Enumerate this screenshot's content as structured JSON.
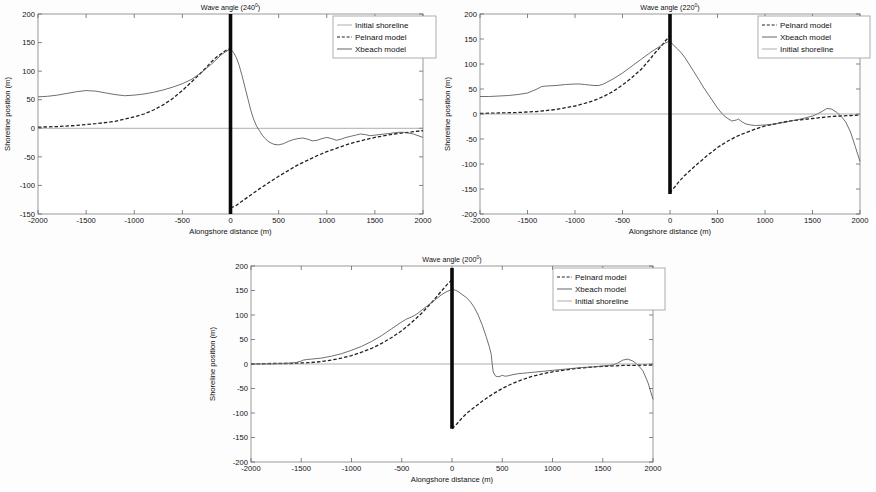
{
  "figure": {
    "panel_count": 3,
    "shared": {
      "xlabel": "Alongshore distance (m)",
      "ylabel": "Shoreline position (m)",
      "xticks": [
        "-2000",
        "-1500",
        "-1000",
        "-500",
        "0",
        "500",
        "1000",
        "1500",
        "2000"
      ],
      "degree_symbol": "0"
    }
  },
  "chart_data": [
    {
      "type": "line",
      "title": "Wave angle (240",
      "title_suffix": ")",
      "title_sup": "0",
      "wave_angle": 240,
      "xlabel": "Alongshore distance (m)",
      "ylabel": "Shoreline position (m)",
      "xlim": [
        -2000,
        2000
      ],
      "ylim": [
        -150,
        200
      ],
      "xticks": [
        -2000,
        -1500,
        -1000,
        -500,
        0,
        500,
        1000,
        1500,
        2000
      ],
      "yticks": [
        -150,
        -100,
        -50,
        0,
        50,
        100,
        150,
        200
      ],
      "ytick_labels": [
        "-150",
        "-100",
        "-50",
        "0",
        "50",
        "100",
        "150",
        "200"
      ],
      "grid": false,
      "legend_position": "upper right",
      "legend": [
        "Initial shoreline",
        "Pelnard model",
        "Xbeach model"
      ],
      "groyne": {
        "x": 0,
        "y_bottom": -150,
        "y_top": 200,
        "label": "groyne"
      },
      "series": [
        {
          "name": "Initial shoreline",
          "style": "thin-solid",
          "x": [
            -2000,
            2000
          ],
          "values": [
            0,
            0
          ]
        },
        {
          "name": "Pelnard model",
          "style": "dashed",
          "x": [
            -2000,
            -1800,
            -1600,
            -1400,
            -1200,
            -1000,
            -900,
            -800,
            -700,
            -600,
            -500,
            -400,
            -300,
            -200,
            -150,
            -100,
            -50,
            -20,
            0,
            0,
            20,
            50,
            100,
            150,
            200,
            300,
            400,
            500,
            600,
            700,
            800,
            900,
            1000,
            1100,
            1200,
            1300,
            1400,
            1500,
            1600,
            1700,
            1800,
            1900,
            2000
          ],
          "values": [
            2,
            3,
            5,
            8,
            12,
            20,
            25,
            32,
            41,
            52,
            66,
            82,
            98,
            116,
            124,
            130,
            136,
            138,
            139,
            -139,
            -138,
            -136,
            -130,
            -124,
            -118,
            -106,
            -95,
            -84,
            -74,
            -64,
            -56,
            -48,
            -41,
            -35,
            -29,
            -24,
            -20,
            -16,
            -13,
            -10,
            -8,
            -6,
            -4
          ]
        },
        {
          "name": "Xbeach model",
          "style": "solid",
          "x": [
            -2000,
            -1900,
            -1800,
            -1700,
            -1600,
            -1500,
            -1400,
            -1300,
            -1200,
            -1100,
            -1000,
            -900,
            -800,
            -700,
            -600,
            -500,
            -400,
            -300,
            -200,
            -100,
            -50,
            0,
            30,
            60,
            90,
            120,
            150,
            180,
            210,
            240,
            270,
            300,
            330,
            360,
            400,
            450,
            500,
            550,
            600,
            650,
            700,
            750,
            800,
            850,
            900,
            950,
            1000,
            1050,
            1100,
            1150,
            1200,
            1250,
            1300,
            1350,
            1400,
            1450,
            1500,
            1600,
            1700,
            1750,
            1800,
            1900,
            2000
          ],
          "values": [
            55,
            56,
            58,
            61,
            64,
            66,
            65,
            62,
            59,
            57,
            58,
            60,
            63,
            67,
            72,
            78,
            86,
            98,
            112,
            128,
            134,
            139,
            133,
            124,
            110,
            92,
            72,
            52,
            32,
            16,
            4,
            -4,
            -12,
            -18,
            -24,
            -28,
            -29,
            -27,
            -23,
            -20,
            -18,
            -17,
            -19,
            -22,
            -21,
            -18,
            -16,
            -18,
            -21,
            -19,
            -16,
            -14,
            -12,
            -10,
            -11,
            -13,
            -12,
            -10,
            -8,
            -7,
            -7,
            -10,
            -16
          ]
        }
      ]
    },
    {
      "type": "line",
      "title": "Wave angle (220",
      "title_suffix": ")",
      "title_sup": "0",
      "wave_angle": 220,
      "xlabel": "Alongshore distance (m)",
      "ylabel": "Shoreline position (m)",
      "xlim": [
        -2000,
        2000
      ],
      "ylim": [
        -200,
        200
      ],
      "xticks": [
        -2000,
        -1500,
        -1000,
        -500,
        0,
        500,
        1000,
        1500,
        2000
      ],
      "yticks": [
        -200,
        -150,
        -100,
        -50,
        0,
        50,
        100,
        150,
        200
      ],
      "ytick_labels": [
        "-200",
        "-150",
        "-100",
        "-50",
        "0",
        "50",
        "100",
        "150",
        "200"
      ],
      "grid": false,
      "legend_position": "upper right",
      "legend": [
        "Pelnard model",
        "Xbeach model",
        "Initial shoreline"
      ],
      "groyne": {
        "x": 0,
        "y_bottom": -160,
        "y_top": 200,
        "label": "groyne"
      },
      "series": [
        {
          "name": "Pelnard model",
          "style": "dashed",
          "x": [
            -2000,
            -1800,
            -1600,
            -1400,
            -1200,
            -1000,
            -900,
            -800,
            -700,
            -600,
            -500,
            -400,
            -300,
            -200,
            -150,
            -100,
            -50,
            -20,
            0,
            0,
            20,
            50,
            100,
            150,
            200,
            300,
            400,
            500,
            600,
            700,
            800,
            900,
            1000,
            1100,
            1200,
            1300,
            1400,
            1500,
            1600,
            1700,
            1800,
            1900,
            2000
          ],
          "values": [
            1,
            2,
            3,
            5,
            9,
            16,
            21,
            27,
            35,
            45,
            58,
            73,
            90,
            112,
            124,
            134,
            146,
            152,
            158,
            -158,
            -152,
            -146,
            -134,
            -124,
            -115,
            -98,
            -82,
            -67,
            -55,
            -45,
            -37,
            -30,
            -24,
            -20,
            -16,
            -13,
            -11,
            -9,
            -7,
            -5,
            -4,
            -3,
            -2
          ]
        },
        {
          "name": "Xbeach model",
          "style": "solid",
          "x": [
            -2000,
            -1900,
            -1800,
            -1700,
            -1600,
            -1500,
            -1400,
            -1350,
            -1300,
            -1200,
            -1100,
            -1000,
            -950,
            -900,
            -850,
            -800,
            -750,
            -700,
            -600,
            -500,
            -400,
            -300,
            -200,
            -100,
            -50,
            0,
            40,
            80,
            120,
            160,
            200,
            250,
            300,
            350,
            400,
            450,
            500,
            550,
            600,
            650,
            700,
            720,
            760,
            800,
            850,
            900,
            1000,
            1100,
            1200,
            1300,
            1400,
            1500,
            1550,
            1600,
            1650,
            1700,
            1750,
            1800,
            1850,
            1900,
            1950,
            2000
          ],
          "values": [
            35,
            35,
            36,
            37,
            39,
            42,
            50,
            55,
            56,
            57,
            59,
            60,
            60,
            59,
            58,
            57,
            57,
            60,
            70,
            82,
            96,
            110,
            124,
            136,
            142,
            146,
            137,
            130,
            122,
            112,
            100,
            85,
            70,
            54,
            40,
            26,
            12,
            0,
            -8,
            -14,
            -12,
            -10,
            -16,
            -20,
            -22,
            -23,
            -22,
            -20,
            -17,
            -13,
            -9,
            -4,
            0,
            5,
            11,
            10,
            4,
            -4,
            -16,
            -36,
            -65,
            -95
          ]
        },
        {
          "name": "Initial shoreline",
          "style": "thin-solid",
          "x": [
            -2000,
            2000
          ],
          "values": [
            0,
            0
          ]
        }
      ]
    },
    {
      "type": "line",
      "title": "Wave angle (200",
      "title_suffix": ")",
      "title_sup": "0",
      "wave_angle": 200,
      "xlabel": "Alongshore distance (m)",
      "ylabel": "Shoreline position (m)",
      "xlim": [
        -2000,
        2000
      ],
      "ylim": [
        -200,
        200
      ],
      "xticks": [
        -2000,
        -1500,
        -1000,
        -500,
        0,
        500,
        1000,
        1500,
        2000
      ],
      "yticks": [
        -200,
        -150,
        -100,
        -50,
        0,
        50,
        100,
        150,
        200
      ],
      "ytick_labels": [
        "-200",
        "-150",
        "-100",
        "-50",
        "0",
        "50",
        "100",
        "150",
        "200"
      ],
      "grid": false,
      "legend_position": "upper right",
      "legend": [
        "Pelnard model",
        "Xbeach model",
        "Initial shoreline"
      ],
      "groyne": {
        "x": 0,
        "y_bottom": -132,
        "y_top": 196,
        "label": "groyne"
      },
      "series": [
        {
          "name": "Pelnard model",
          "style": "dashed",
          "x": [
            -2000,
            -1800,
            -1600,
            -1500,
            -1400,
            -1300,
            -1200,
            -1100,
            -1000,
            -900,
            -800,
            -700,
            -600,
            -500,
            -400,
            -300,
            -200,
            -150,
            -100,
            -50,
            -20,
            0,
            0,
            20,
            50,
            100,
            150,
            200,
            300,
            400,
            500,
            600,
            700,
            800,
            900,
            1000,
            1100,
            1200,
            1300,
            1400,
            1500,
            1600,
            1700,
            1800,
            1900,
            2000
          ],
          "values": [
            0,
            1,
            1,
            2,
            3,
            5,
            8,
            12,
            17,
            24,
            32,
            42,
            54,
            68,
            85,
            104,
            126,
            138,
            150,
            162,
            168,
            172,
            -132,
            -128,
            -122,
            -110,
            -100,
            -92,
            -76,
            -62,
            -50,
            -40,
            -32,
            -25,
            -20,
            -16,
            -13,
            -10,
            -8,
            -6,
            -5,
            -4,
            -3,
            -3,
            -2,
            -2
          ]
        },
        {
          "name": "Xbeach model",
          "style": "solid",
          "x": [
            -2000,
            -1900,
            -1800,
            -1700,
            -1600,
            -1550,
            -1500,
            -1480,
            -1450,
            -1400,
            -1300,
            -1200,
            -1100,
            -1000,
            -900,
            -800,
            -700,
            -600,
            -500,
            -450,
            -400,
            -350,
            -300,
            -250,
            -200,
            -150,
            -100,
            -50,
            0,
            30,
            60,
            100,
            140,
            180,
            220,
            260,
            300,
            340,
            370,
            390,
            400,
            410,
            430,
            450,
            480,
            500,
            530,
            560,
            600,
            650,
            700,
            750,
            800,
            900,
            1000,
            1100,
            1200,
            1300,
            1400,
            1500,
            1600,
            1650,
            1700,
            1750,
            1800,
            1850,
            1900,
            1950,
            2000
          ],
          "values": [
            0,
            0,
            0,
            1,
            2,
            3,
            6,
            8,
            9,
            10,
            12,
            16,
            21,
            28,
            36,
            46,
            58,
            72,
            86,
            92,
            96,
            102,
            110,
            118,
            126,
            134,
            142,
            148,
            152,
            151,
            148,
            142,
            136,
            128,
            116,
            100,
            80,
            56,
            36,
            20,
            0,
            -16,
            -24,
            -26,
            -25,
            -23,
            -25,
            -24,
            -22,
            -20,
            -19,
            -18,
            -17,
            -15,
            -13,
            -11,
            -9,
            -7,
            -6,
            -4,
            -2,
            2,
            8,
            10,
            6,
            -2,
            -14,
            -38,
            -72,
            -95
          ]
        },
        {
          "name": "Initial shoreline",
          "style": "thin-solid",
          "x": [
            -2000,
            2000
          ],
          "values": [
            0,
            0
          ]
        }
      ]
    }
  ]
}
